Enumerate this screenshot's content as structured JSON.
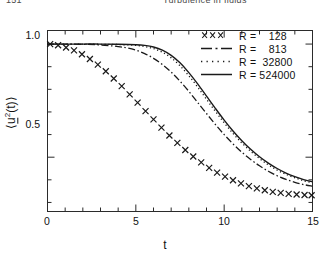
{
  "page": {
    "folio": "151",
    "running_head": "Turbulence in fluids"
  },
  "axes": {
    "y_title_prefix": "⟨",
    "y_title_var": "u",
    "y_title_sup": "2",
    "y_title_arg": "(t)",
    "y_title_suffix": "⟩",
    "x_title": "t",
    "y_ticks": [
      "1.0",
      "0.5"
    ],
    "x_ticks": [
      "0",
      "5",
      "10",
      "15"
    ]
  },
  "legend": {
    "entries": [
      {
        "sample": "cross-markers",
        "label": "R =    128"
      },
      {
        "sample": "dash-dot-line",
        "label": "R =    813"
      },
      {
        "sample": "dotted-line",
        "label": "R =  32800"
      },
      {
        "sample": "solid-line",
        "label": "R = 524000"
      }
    ]
  },
  "colors": {
    "ink": "#1a1a1a",
    "axis": "#2b2b2b",
    "background": "#ffffff"
  },
  "chart_data": {
    "type": "line",
    "title": "",
    "xlabel": "t",
    "ylabel": "<u^2(t)>",
    "xlim": [
      0,
      15
    ],
    "ylim": [
      0.26,
      1.06
    ],
    "grid": false,
    "legend_position": "top-right",
    "x_major_ticks": [
      0,
      5,
      10,
      15
    ],
    "x_minor_tick_interval": 1,
    "y_major_ticks": [
      0.5,
      1.0
    ],
    "y_minor_tick_interval": 0.1,
    "series": [
      {
        "name": "R = 128",
        "style": "markers",
        "marker": "x",
        "x": [
          0.15,
          0.6,
          1.05,
          1.5,
          1.95,
          2.4,
          2.85,
          3.3,
          3.75,
          4.2,
          4.65,
          5.1,
          5.55,
          6.0,
          6.45,
          6.9,
          7.35,
          7.8,
          8.25,
          8.7,
          9.15,
          9.6,
          10.05,
          10.5,
          10.95,
          11.4,
          11.85,
          12.3,
          12.75,
          13.2,
          13.65,
          14.1,
          14.55,
          14.95
        ],
        "y": [
          1.0,
          0.995,
          0.985,
          0.972,
          0.955,
          0.934,
          0.909,
          0.88,
          0.848,
          0.814,
          0.778,
          0.741,
          0.704,
          0.667,
          0.631,
          0.596,
          0.563,
          0.532,
          0.503,
          0.477,
          0.453,
          0.432,
          0.414,
          0.398,
          0.384,
          0.372,
          0.362,
          0.354,
          0.347,
          0.342,
          0.338,
          0.335,
          0.333,
          0.332
        ]
      },
      {
        "name": "R = 813",
        "style": "dash-dot",
        "x": [
          0,
          1,
          2,
          3,
          4,
          4.5,
          5,
          5.5,
          6,
          6.5,
          7,
          7.5,
          8,
          8.5,
          9,
          9.5,
          10,
          10.5,
          11,
          11.5,
          12,
          12.5,
          13,
          13.5,
          14,
          14.5,
          15
        ],
        "y": [
          1.0,
          1.0,
          0.999,
          0.996,
          0.989,
          0.983,
          0.973,
          0.958,
          0.937,
          0.91,
          0.876,
          0.836,
          0.791,
          0.742,
          0.693,
          0.645,
          0.6,
          0.559,
          0.522,
          0.49,
          0.462,
          0.438,
          0.418,
          0.402,
          0.389,
          0.379,
          0.372
        ]
      },
      {
        "name": "R = 32800",
        "style": "dotted",
        "x": [
          0,
          1,
          2,
          3,
          4,
          5,
          5.5,
          6,
          6.5,
          7,
          7.5,
          8,
          8.5,
          9,
          9.5,
          10,
          10.5,
          11,
          11.5,
          12,
          12.5,
          13,
          13.5,
          14,
          14.5,
          15
        ],
        "y": [
          1.0,
          1.0,
          1.0,
          0.999,
          0.998,
          0.994,
          0.989,
          0.98,
          0.964,
          0.939,
          0.904,
          0.86,
          0.81,
          0.756,
          0.703,
          0.652,
          0.605,
          0.563,
          0.526,
          0.494,
          0.466,
          0.443,
          0.424,
          0.409,
          0.396,
          0.387
        ]
      },
      {
        "name": "R = 524000",
        "style": "solid",
        "x": [
          0,
          1,
          2,
          3,
          4,
          5,
          5.5,
          6,
          6.5,
          7,
          7.5,
          8,
          8.5,
          9,
          9.5,
          10,
          10.5,
          11,
          11.5,
          12,
          12.5,
          13,
          13.5,
          14,
          14.5,
          15
        ],
        "y": [
          1.0,
          1.0,
          1.0,
          1.0,
          0.999,
          0.997,
          0.994,
          0.987,
          0.973,
          0.95,
          0.917,
          0.874,
          0.824,
          0.77,
          0.716,
          0.664,
          0.616,
          0.573,
          0.535,
          0.502,
          0.474,
          0.45,
          0.43,
          0.414,
          0.401,
          0.391
        ]
      }
    ]
  }
}
